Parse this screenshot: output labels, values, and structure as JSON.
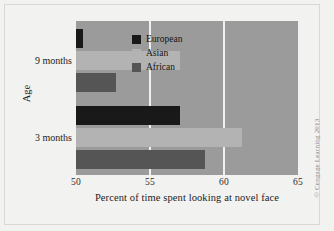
{
  "chart_data": {
    "type": "bar",
    "orientation": "horizontal",
    "title": "",
    "xlabel": "Percent of time spent looking at novel face",
    "ylabel": "Age",
    "categories": [
      "3 months",
      "9 months"
    ],
    "xlim": [
      50,
      65
    ],
    "xticks": [
      50,
      55,
      60,
      65
    ],
    "xtick_labels": [
      "50",
      "55",
      "60",
      "65"
    ],
    "grid": true,
    "grid_axis": "x",
    "legend_position": "upper right inside",
    "series": [
      {
        "name": "European",
        "color": "#191919",
        "values": [
          57.0,
          50.5
        ]
      },
      {
        "name": "Asian",
        "color": "#b3b3b3",
        "values": [
          61.2,
          57.0
        ]
      },
      {
        "name": "African",
        "color": "#555555",
        "values": [
          58.7,
          52.7
        ]
      }
    ],
    "plot_background": "#9b9b9b",
    "figure_background": "#f2f2f0"
  },
  "axis": {
    "x_title": "Percent of time spent looking at novel face",
    "y_title": "Age",
    "ticks": [
      {
        "label": "50",
        "value": 50
      },
      {
        "label": "55",
        "value": 55
      },
      {
        "label": "60",
        "value": 60
      },
      {
        "label": "65",
        "value": 65
      }
    ],
    "categories": [
      {
        "label": "9 months"
      },
      {
        "label": "3 months"
      }
    ]
  },
  "legend": {
    "items": [
      {
        "label": "European",
        "color": "#191919"
      },
      {
        "label": "Asian",
        "color": "#b3b3b3"
      },
      {
        "label": "African",
        "color": "#555555"
      }
    ]
  },
  "credit": {
    "text": "© Cengage Learning 2013"
  }
}
